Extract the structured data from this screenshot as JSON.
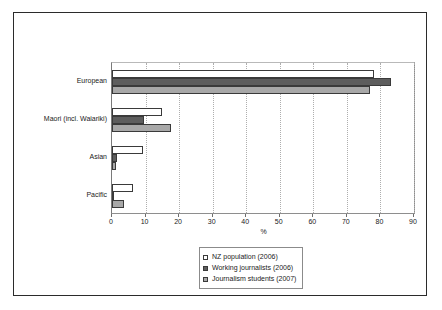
{
  "chart_data": {
    "type": "bar",
    "orientation": "horizontal",
    "title": "",
    "xlabel": "%",
    "ylabel": "",
    "xlim": [
      0,
      90
    ],
    "xticks": [
      0,
      10,
      20,
      30,
      40,
      50,
      60,
      70,
      80,
      90
    ],
    "grid": true,
    "legend_position": "bottom-center",
    "categories": [
      "European",
      "Maori (incl. Waiariki)",
      "Asian",
      "Pacific"
    ],
    "series": [
      {
        "name": "NZ population (2006)",
        "color": "#ffffff",
        "values": [
          78.0,
          15.0,
          9.2,
          6.2
        ]
      },
      {
        "name": "Working journalists (2006)",
        "color": "#5d5d5d",
        "values": [
          83.0,
          9.5,
          1.5,
          0.7
        ]
      },
      {
        "name": "Journalism students (2007)",
        "color": "#a8a8a8",
        "values": [
          77.0,
          17.5,
          1.2,
          3.5
        ]
      }
    ]
  },
  "legend": {
    "items": [
      {
        "label": "NZ population (2006)"
      },
      {
        "label": "Working journalists (2006)"
      },
      {
        "label": "Journalism students (2007)"
      }
    ]
  }
}
